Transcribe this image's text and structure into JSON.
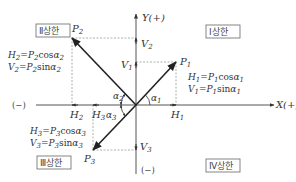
{
  "diagram": {
    "type": "vector-quadrant-decomposition",
    "axes": {
      "x_positive_label": "X(+)",
      "x_negative_label": "(−)",
      "y_positive_label": "Y(+)",
      "y_negative_label": "(−)"
    },
    "quadrants": {
      "q1": "Ⅰ상한",
      "q2": "Ⅱ상한",
      "q3": "Ⅲ상한",
      "q4": "Ⅳ상한"
    },
    "vectors": [
      {
        "name": "P",
        "sub": "1",
        "h_label": "H",
        "h_sub": "1",
        "v_label": "V",
        "v_sub": "1",
        "angle": "α",
        "angle_sub": "1",
        "eq_h": {
          "lhs": "H",
          "lhs_sub": "1",
          "p": "P",
          "p_sub": "1",
          "fn": "cos",
          "a": "α",
          "a_sub": "1"
        },
        "eq_v": {
          "lhs": "V",
          "lhs_sub": "1",
          "p": "P",
          "p_sub": "1",
          "fn": "sin",
          "a": "α",
          "a_sub": "1"
        }
      },
      {
        "name": "P",
        "sub": "2",
        "h_label": "H",
        "h_sub": "2",
        "v_label": "V",
        "v_sub": "2",
        "angle": "α",
        "angle_sub": "2",
        "eq_h": {
          "lhs": "H",
          "lhs_sub": "2",
          "p": "P",
          "p_sub": "2",
          "fn": "cos",
          "a": "α",
          "a_sub": "2"
        },
        "eq_v": {
          "lhs": "V",
          "lhs_sub": "2",
          "p": "P",
          "p_sub": "2",
          "fn": "sin",
          "a": "α",
          "a_sub": "2"
        }
      },
      {
        "name": "P",
        "sub": "3",
        "h_label": "H",
        "h_sub": "3",
        "v_label": "V",
        "v_sub": "3",
        "angle": "α",
        "angle_sub": "3",
        "eq_h": {
          "lhs": "H",
          "lhs_sub": "3",
          "p": "P",
          "p_sub": "3",
          "fn": "cos",
          "a": "α",
          "a_sub": "3"
        },
        "eq_v": {
          "lhs": "V",
          "lhs_sub": "3",
          "p": "P",
          "p_sub": "3",
          "fn": "sin",
          "a": "α",
          "a_sub": "3"
        }
      }
    ],
    "colors": {
      "axis": "#555555",
      "vector": "#222222",
      "dashed": "#999999",
      "box_border": "#666666"
    }
  }
}
